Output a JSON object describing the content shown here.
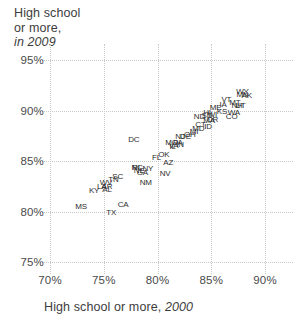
{
  "chart_data": {
    "type": "scatter",
    "title": "",
    "ylabel_lines": [
      "High school",
      "or more,",
      "in 2009"
    ],
    "ylabel_italic_part": "in 2009",
    "xlabel": "High school or more, 2000",
    "xlabel_italic_part": "2000",
    "xlim": [
      70,
      90
    ],
    "ylim": [
      75,
      95
    ],
    "xticks": [
      "70%",
      "75%",
      "80%",
      "85%",
      "90%"
    ],
    "xtick_values": [
      70,
      75,
      80,
      85,
      90
    ],
    "yticks": [
      "75%",
      "80%",
      "85%",
      "90%",
      "95%"
    ],
    "ytick_values": [
      75,
      80,
      85,
      90,
      95
    ],
    "grid": true,
    "legend": "none",
    "point_label_field": "state",
    "points": [
      {
        "state": "MS",
        "x": 72.9,
        "y": 80.4
      },
      {
        "state": "TX",
        "x": 75.7,
        "y": 79.9
      },
      {
        "state": "CA",
        "x": 76.8,
        "y": 80.6
      },
      {
        "state": "KY",
        "x": 74.1,
        "y": 82.0
      },
      {
        "state": "AL",
        "x": 75.3,
        "y": 82.1
      },
      {
        "state": "WV",
        "x": 75.2,
        "y": 82.8
      },
      {
        "state": "NC",
        "x": 78.1,
        "y": 84.3
      },
      {
        "state": "SC",
        "x": 76.3,
        "y": 83.4
      },
      {
        "state": "NM",
        "x": 78.9,
        "y": 82.8
      },
      {
        "state": "DC",
        "x": 77.8,
        "y": 87.1
      },
      {
        "state": "GA",
        "x": 78.6,
        "y": 83.8
      },
      {
        "state": "NE",
        "x": 78.3,
        "y": 84.0
      },
      {
        "state": "NY",
        "x": 79.1,
        "y": 84.2
      },
      {
        "state": "RI",
        "x": 78.0,
        "y": 84.3
      },
      {
        "state": "NV",
        "x": 80.7,
        "y": 83.7
      },
      {
        "state": "FL",
        "x": 79.9,
        "y": 85.3
      },
      {
        "state": "OK",
        "x": 80.6,
        "y": 85.6
      },
      {
        "state": "LA",
        "x": 74.8,
        "y": 82.4
      },
      {
        "state": "AR",
        "x": 75.3,
        "y": 82.4
      },
      {
        "state": "TN",
        "x": 75.9,
        "y": 83.1
      },
      {
        "state": "MA",
        "x": 84.8,
        "y": 89.0
      },
      {
        "state": "IN",
        "x": 82.1,
        "y": 86.6
      },
      {
        "state": "AZ",
        "x": 81.0,
        "y": 84.8
      },
      {
        "state": "VA",
        "x": 81.5,
        "y": 86.5
      },
      {
        "state": "DE",
        "x": 82.6,
        "y": 87.4
      },
      {
        "state": "MD",
        "x": 83.8,
        "y": 88.2
      },
      {
        "state": "IL",
        "x": 81.4,
        "y": 86.4
      },
      {
        "state": "ME",
        "x": 85.4,
        "y": 90.2
      },
      {
        "state": "CT",
        "x": 84.0,
        "y": 88.6
      },
      {
        "state": "PA",
        "x": 81.9,
        "y": 86.8
      },
      {
        "state": "OH",
        "x": 83.0,
        "y": 87.6
      },
      {
        "state": "MI",
        "x": 83.4,
        "y": 87.9
      },
      {
        "state": "ID",
        "x": 84.7,
        "y": 88.4
      },
      {
        "state": "WA",
        "x": 87.1,
        "y": 89.8
      },
      {
        "state": "OR",
        "x": 85.1,
        "y": 89.1
      },
      {
        "state": "MO",
        "x": 81.3,
        "y": 86.8
      },
      {
        "state": "SD",
        "x": 84.6,
        "y": 89.5
      },
      {
        "state": "NJ",
        "x": 82.1,
        "y": 87.4
      },
      {
        "state": "ND",
        "x": 83.9,
        "y": 89.4
      },
      {
        "state": "HI",
        "x": 84.6,
        "y": 89.8
      },
      {
        "state": "IA",
        "x": 86.1,
        "y": 90.5
      },
      {
        "state": "VT",
        "x": 86.4,
        "y": 91.0
      },
      {
        "state": "MN",
        "x": 87.9,
        "y": 91.5
      },
      {
        "state": "AK",
        "x": 88.3,
        "y": 91.4
      },
      {
        "state": "WY",
        "x": 87.9,
        "y": 91.8
      },
      {
        "state": "UT",
        "x": 87.7,
        "y": 90.4
      },
      {
        "state": "WI",
        "x": 85.1,
        "y": 89.6
      },
      {
        "state": "KS",
        "x": 86.0,
        "y": 89.9
      },
      {
        "state": "MT",
        "x": 87.2,
        "y": 90.7
      },
      {
        "state": "CO",
        "x": 86.9,
        "y": 89.4
      },
      {
        "state": "NH",
        "x": 87.4,
        "y": 90.4
      }
    ]
  }
}
